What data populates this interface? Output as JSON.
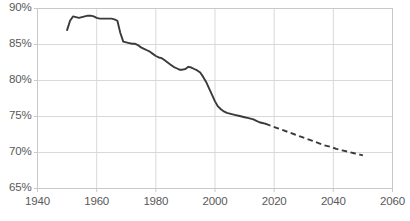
{
  "chart_data": {
    "type": "line",
    "title": "",
    "subtitle": "",
    "xlabel": "",
    "ylabel": "",
    "xlim": [
      1940,
      2060
    ],
    "ylim": [
      65,
      90
    ],
    "grid": true,
    "legend": null,
    "y_tick_labels": [
      "65%",
      "70%",
      "75%",
      "80%",
      "85%",
      "90%"
    ],
    "y_ticks": [
      65,
      70,
      75,
      80,
      85,
      90
    ],
    "x_tick_labels": [
      "1940",
      "1960",
      "1980",
      "2000",
      "2020",
      "2040",
      "2060"
    ],
    "x_ticks": [
      1940,
      1960,
      1980,
      2000,
      2020,
      2040,
      2060
    ],
    "y_unit": "%",
    "series": [
      {
        "name": "historical",
        "style": "solid",
        "color": "#3a3a3a",
        "x": [
          1950,
          1951,
          1952,
          1953,
          1954,
          1955,
          1956,
          1957,
          1958,
          1959,
          1960,
          1961,
          1962,
          1963,
          1964,
          1965,
          1966,
          1967,
          1968,
          1969,
          1970,
          1971,
          1972,
          1973,
          1974,
          1975,
          1976,
          1977,
          1978,
          1979,
          1980,
          1981,
          1982,
          1983,
          1984,
          1985,
          1986,
          1987,
          1988,
          1989,
          1990,
          1991,
          1992,
          1993,
          1994,
          1995,
          1996,
          1997,
          1998,
          1999,
          2000,
          2001,
          2002,
          2003,
          2004,
          2005,
          2006,
          2007,
          2008,
          2009,
          2010,
          2011,
          2012,
          2013,
          2014,
          2015,
          2016,
          2017
        ],
        "values": [
          87.0,
          88.3,
          88.9,
          88.8,
          88.7,
          88.8,
          88.9,
          89.0,
          89.0,
          88.9,
          88.7,
          88.6,
          88.6,
          88.6,
          88.6,
          88.6,
          88.5,
          88.3,
          86.6,
          85.4,
          85.3,
          85.2,
          85.1,
          85.1,
          84.9,
          84.6,
          84.4,
          84.2,
          84.0,
          83.7,
          83.4,
          83.2,
          83.1,
          82.8,
          82.5,
          82.2,
          81.9,
          81.7,
          81.5,
          81.5,
          81.6,
          81.9,
          81.8,
          81.6,
          81.4,
          81.1,
          80.5,
          79.8,
          78.9,
          78.0,
          77.1,
          76.4,
          76.0,
          75.7,
          75.5,
          75.4,
          75.3,
          75.2,
          75.1,
          75.0,
          74.9,
          74.8,
          74.7,
          74.6,
          74.4,
          74.2,
          74.1,
          74.0
        ]
      },
      {
        "name": "projection",
        "style": "dashed",
        "color": "#3a3a3a",
        "x": [
          2017,
          2019,
          2021,
          2023,
          2025,
          2027,
          2029,
          2031,
          2033,
          2035,
          2037,
          2039,
          2041,
          2043,
          2045,
          2047,
          2049,
          2050
        ],
        "values": [
          74.0,
          73.7,
          73.4,
          73.1,
          72.8,
          72.5,
          72.2,
          71.9,
          71.6,
          71.3,
          71.0,
          70.8,
          70.5,
          70.3,
          70.1,
          69.9,
          69.7,
          69.6
        ]
      }
    ]
  },
  "style": {
    "line_color": "#3a3a3a",
    "grid_color": "#d9d9d9",
    "axis_color": "#c9c9c9",
    "tick_label_color": "#595959",
    "background": "#ffffff"
  }
}
